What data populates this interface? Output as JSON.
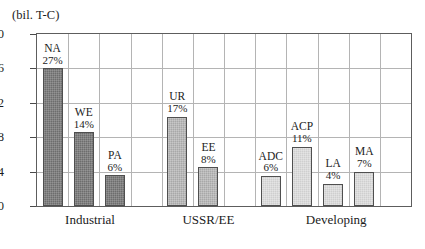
{
  "chart_data": {
    "type": "bar",
    "title": "",
    "subtitle": "",
    "xlabel": "",
    "ylabel": "(bil. T-C)",
    "ylim": [
      0.0,
      2.0
    ],
    "ytick_labels": [
      "0.0",
      "0.4",
      "0.8",
      "1.2",
      "1.6",
      "2.0"
    ],
    "ytick_values": [
      0.0,
      0.4,
      0.8,
      1.2,
      1.6,
      2.0
    ],
    "grid": "both",
    "legend": "none",
    "slot_count": 12,
    "categories": [
      "NA",
      "WE",
      "PA",
      "UR",
      "EE",
      "ADC",
      "ACP",
      "LA",
      "MA"
    ],
    "values": [
      1.6,
      0.86,
      0.36,
      1.04,
      0.45,
      0.35,
      0.69,
      0.26,
      0.4
    ],
    "bars": [
      {
        "name": "NA",
        "percent": "27%",
        "value": 1.6,
        "slot": 0,
        "group": "Industrial",
        "shade": "shade-dark"
      },
      {
        "name": "WE",
        "percent": "14%",
        "value": 0.86,
        "slot": 1,
        "group": "Industrial",
        "shade": "shade-dark"
      },
      {
        "name": "PA",
        "percent": "6%",
        "value": 0.36,
        "slot": 2,
        "group": "Industrial",
        "shade": "shade-dark"
      },
      {
        "name": "UR",
        "percent": "17%",
        "value": 1.04,
        "slot": 4,
        "group": "USSR/EE",
        "shade": "shade-mid"
      },
      {
        "name": "EE",
        "percent": "8%",
        "value": 0.45,
        "slot": 5,
        "group": "USSR/EE",
        "shade": "shade-mid"
      },
      {
        "name": "ADC",
        "percent": "6%",
        "value": 0.35,
        "slot": 7,
        "group": "Developing",
        "shade": "shade-light"
      },
      {
        "name": "ACP",
        "percent": "11%",
        "value": 0.69,
        "slot": 8,
        "group": "Developing",
        "shade": "shade-light"
      },
      {
        "name": "LA",
        "percent": "4%",
        "value": 0.26,
        "slot": 9,
        "group": "Developing",
        "shade": "shade-light"
      },
      {
        "name": "MA",
        "percent": "7%",
        "value": 0.4,
        "slot": 10,
        "group": "Developing",
        "shade": "shade-light"
      }
    ],
    "groups": [
      {
        "label": "Industrial",
        "center_slot": 1.2
      },
      {
        "label": "USSR/EE",
        "center_slot": 5.0
      },
      {
        "label": "Developing",
        "center_slot": 9.1
      }
    ],
    "colors": {
      "industrial_bar": "#6d6d6d",
      "ussr_ee_bar": "#a8a8a8",
      "developing_bar": "#cfcfcf",
      "bar_outline": "#4f4f4f",
      "gridline": "#b4b4b4",
      "frame": "#5d5d5d",
      "text": "#1b1b1b",
      "background": "#ffffff"
    }
  }
}
